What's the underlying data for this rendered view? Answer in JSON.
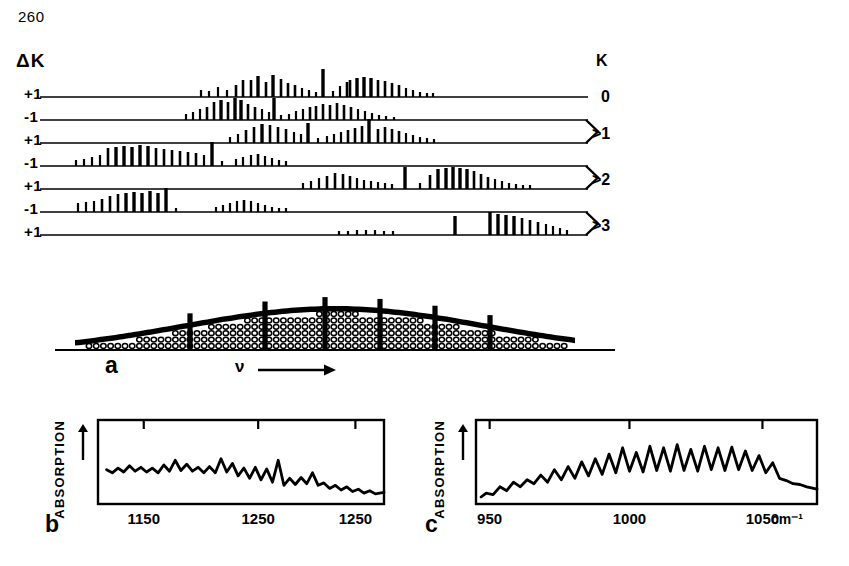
{
  "page_number": "260",
  "panel_a": {
    "left_axis_title": "ΔK",
    "right_axis_title": "K",
    "delta_k_labels": [
      "+1",
      "-1",
      "+1",
      "-1",
      "+1",
      "-1",
      "+1"
    ],
    "k_labels": [
      {
        "text": "0",
        "brace": false
      },
      {
        "text": "1",
        "brace": true
      },
      {
        "text": "2",
        "brace": true
      },
      {
        "text": "3",
        "brace": true
      }
    ],
    "k_brace_prefix": ">",
    "frequency_axis_label": "ν",
    "panel_label": "a",
    "traces": [
      {
        "delta_k": "+1",
        "k": "0",
        "sticks": [
          [
            201,
            7
          ],
          [
            209,
            6
          ],
          [
            218,
            10
          ],
          [
            227,
            7
          ],
          [
            236,
            12
          ],
          [
            243,
            17
          ],
          [
            251,
            17
          ],
          [
            258,
            21
          ],
          [
            266,
            15
          ],
          [
            273,
            22
          ],
          [
            281,
            18
          ],
          [
            288,
            14
          ],
          [
            295,
            12
          ],
          [
            302,
            9
          ],
          [
            309,
            7
          ],
          [
            316,
            5
          ],
          [
            323,
            28
          ],
          [
            333,
            6
          ],
          [
            340,
            11
          ],
          [
            347,
            15
          ],
          [
            350,
            17
          ],
          [
            357,
            19
          ],
          [
            364,
            20
          ],
          [
            371,
            19
          ],
          [
            378,
            17
          ],
          [
            385,
            16
          ],
          [
            392,
            14
          ],
          [
            399,
            12
          ],
          [
            406,
            9
          ],
          [
            413,
            7
          ],
          [
            420,
            5
          ],
          [
            427,
            4
          ],
          [
            433,
            4
          ]
        ]
      },
      {
        "delta_k": "-1",
        "k": "0",
        "sticks": [
          [
            186,
            6
          ],
          [
            193,
            8
          ],
          [
            200,
            11
          ],
          [
            207,
            13
          ],
          [
            214,
            18
          ],
          [
            221,
            20
          ],
          [
            228,
            18
          ],
          [
            235,
            22
          ],
          [
            241,
            20
          ],
          [
            248,
            16
          ],
          [
            255,
            13
          ],
          [
            262,
            11
          ],
          [
            269,
            8
          ],
          [
            274,
            22
          ],
          [
            281,
            5
          ],
          [
            289,
            6
          ],
          [
            296,
            9
          ],
          [
            303,
            11
          ],
          [
            310,
            13
          ],
          [
            316,
            14
          ],
          [
            323,
            16
          ],
          [
            330,
            15
          ],
          [
            337,
            17
          ],
          [
            344,
            15
          ],
          [
            351,
            13
          ],
          [
            358,
            11
          ],
          [
            365,
            9
          ],
          [
            372,
            7
          ],
          [
            379,
            5
          ],
          [
            386,
            4
          ],
          [
            394,
            3
          ]
        ]
      },
      {
        "delta_k": "+1",
        "k": "1",
        "sticks": [
          [
            230,
            6
          ],
          [
            238,
            9
          ],
          [
            246,
            13
          ],
          [
            254,
            16
          ],
          [
            262,
            19
          ],
          [
            270,
            18
          ],
          [
            278,
            16
          ],
          [
            286,
            14
          ],
          [
            294,
            11
          ],
          [
            301,
            9
          ],
          [
            308,
            20
          ],
          [
            318,
            5
          ],
          [
            327,
            7
          ],
          [
            334,
            9
          ],
          [
            341,
            11
          ],
          [
            348,
            13
          ],
          [
            355,
            15
          ],
          [
            362,
            17
          ],
          [
            369,
            24
          ],
          [
            378,
            14
          ],
          [
            385,
            16
          ],
          [
            392,
            14
          ],
          [
            399,
            12
          ],
          [
            406,
            10
          ],
          [
            413,
            8
          ],
          [
            420,
            6
          ],
          [
            427,
            5
          ],
          [
            434,
            4
          ]
        ]
      },
      {
        "delta_k": "-1",
        "k": "1",
        "sticks": [
          [
            76,
            6
          ],
          [
            84,
            7
          ],
          [
            92,
            9
          ],
          [
            100,
            11
          ],
          [
            108,
            18
          ],
          [
            116,
            19
          ],
          [
            124,
            20
          ],
          [
            132,
            19
          ],
          [
            140,
            21
          ],
          [
            148,
            20
          ],
          [
            156,
            18
          ],
          [
            164,
            17
          ],
          [
            172,
            16
          ],
          [
            180,
            15
          ],
          [
            188,
            14
          ],
          [
            196,
            13
          ],
          [
            204,
            11
          ],
          [
            212,
            24
          ],
          [
            222,
            5
          ],
          [
            236,
            7
          ],
          [
            243,
            9
          ],
          [
            251,
            11
          ],
          [
            258,
            12
          ],
          [
            265,
            10
          ],
          [
            272,
            8
          ],
          [
            279,
            6
          ],
          [
            286,
            5
          ]
        ]
      },
      {
        "delta_k": "+1",
        "k": "2",
        "sticks": [
          [
            303,
            6
          ],
          [
            311,
            8
          ],
          [
            319,
            11
          ],
          [
            327,
            13
          ],
          [
            335,
            16
          ],
          [
            343,
            15
          ],
          [
            350,
            13
          ],
          [
            357,
            11
          ],
          [
            364,
            9
          ],
          [
            371,
            8
          ],
          [
            378,
            7
          ],
          [
            385,
            6
          ],
          [
            392,
            5
          ],
          [
            405,
            22
          ],
          [
            420,
            6
          ],
          [
            430,
            14
          ],
          [
            438,
            20
          ],
          [
            446,
            21
          ],
          [
            453,
            22
          ],
          [
            460,
            21
          ],
          [
            467,
            20
          ],
          [
            474,
            18
          ],
          [
            481,
            15
          ],
          [
            488,
            12
          ],
          [
            495,
            10
          ],
          [
            502,
            8
          ],
          [
            509,
            6
          ],
          [
            516,
            5
          ],
          [
            523,
            4
          ],
          [
            530,
            4
          ]
        ]
      },
      {
        "delta_k": "-1",
        "k": "2",
        "sticks": [
          [
            78,
            9
          ],
          [
            86,
            10
          ],
          [
            94,
            11
          ],
          [
            102,
            13
          ],
          [
            110,
            16
          ],
          [
            118,
            18
          ],
          [
            126,
            19
          ],
          [
            134,
            20
          ],
          [
            142,
            19
          ],
          [
            150,
            21
          ],
          [
            158,
            19
          ],
          [
            166,
            24
          ],
          [
            176,
            4
          ],
          [
            216,
            5
          ],
          [
            223,
            7
          ],
          [
            230,
            9
          ],
          [
            237,
            11
          ],
          [
            244,
            12
          ],
          [
            251,
            11
          ],
          [
            258,
            9
          ],
          [
            265,
            7
          ],
          [
            272,
            5
          ],
          [
            279,
            4
          ],
          [
            286,
            4
          ]
        ]
      },
      {
        "delta_k": "+1",
        "k": "3",
        "sticks": [
          [
            339,
            4
          ],
          [
            348,
            4
          ],
          [
            357,
            5
          ],
          [
            366,
            5
          ],
          [
            375,
            5
          ],
          [
            384,
            4
          ],
          [
            393,
            4
          ],
          [
            455,
            19
          ],
          [
            490,
            23
          ],
          [
            498,
            21
          ],
          [
            506,
            20
          ],
          [
            514,
            19
          ],
          [
            522,
            17
          ],
          [
            530,
            15
          ],
          [
            538,
            13
          ],
          [
            546,
            11
          ],
          [
            553,
            9
          ],
          [
            560,
            7
          ],
          [
            567,
            5
          ]
        ]
      }
    ],
    "envelope": {
      "description": "band contour with stippled sub-band regions",
      "tick_positions": [
        170,
        245,
        305,
        360,
        415,
        470
      ],
      "stipple_fill": true
    }
  },
  "panel_b": {
    "panel_label": "b",
    "y_axis_label": "ABSORPTION",
    "y_axis_arrow": "up-arrow",
    "x_ticks": [
      "1150",
      "1250",
      "1250"
    ],
    "x_tick_positions": [
      0.16,
      0.56,
      0.9
    ],
    "spectrum": {
      "type": "line",
      "description": "rotationally resolved absorption band, decaying to the red",
      "points": [
        [
          0.03,
          0.44
        ],
        [
          0.05,
          0.4
        ],
        [
          0.07,
          0.46
        ],
        [
          0.09,
          0.41
        ],
        [
          0.11,
          0.49
        ],
        [
          0.13,
          0.42
        ],
        [
          0.15,
          0.47
        ],
        [
          0.17,
          0.41
        ],
        [
          0.19,
          0.46
        ],
        [
          0.21,
          0.4
        ],
        [
          0.23,
          0.5
        ],
        [
          0.25,
          0.42
        ],
        [
          0.27,
          0.56
        ],
        [
          0.29,
          0.43
        ],
        [
          0.31,
          0.51
        ],
        [
          0.33,
          0.42
        ],
        [
          0.35,
          0.47
        ],
        [
          0.37,
          0.4
        ],
        [
          0.39,
          0.48
        ],
        [
          0.41,
          0.4
        ],
        [
          0.43,
          0.58
        ],
        [
          0.45,
          0.41
        ],
        [
          0.47,
          0.52
        ],
        [
          0.49,
          0.36
        ],
        [
          0.51,
          0.46
        ],
        [
          0.53,
          0.33
        ],
        [
          0.55,
          0.47
        ],
        [
          0.57,
          0.31
        ],
        [
          0.59,
          0.45
        ],
        [
          0.61,
          0.28
        ],
        [
          0.63,
          0.56
        ],
        [
          0.65,
          0.24
        ],
        [
          0.67,
          0.33
        ],
        [
          0.69,
          0.25
        ],
        [
          0.71,
          0.34
        ],
        [
          0.73,
          0.26
        ],
        [
          0.75,
          0.4
        ],
        [
          0.77,
          0.24
        ],
        [
          0.79,
          0.27
        ],
        [
          0.81,
          0.2
        ],
        [
          0.83,
          0.24
        ],
        [
          0.85,
          0.18
        ],
        [
          0.87,
          0.22
        ],
        [
          0.89,
          0.16
        ],
        [
          0.91,
          0.19
        ],
        [
          0.93,
          0.14
        ],
        [
          0.95,
          0.17
        ],
        [
          0.97,
          0.13
        ],
        [
          1.0,
          0.15
        ]
      ]
    }
  },
  "panel_c": {
    "panel_label": "c",
    "y_axis_label": "ABSORPTION",
    "y_axis_arrow": "up-arrow",
    "x_ticks": [
      "950",
      "1000",
      "1050"
    ],
    "x_tick_positions": [
      0.04,
      0.45,
      0.84
    ],
    "x_unit": "cm⁻¹",
    "spectrum": {
      "type": "line",
      "description": "regularly spaced rotational structure peaking near 1010 cm-1",
      "points": [
        [
          0.015,
          0.09
        ],
        [
          0.03,
          0.14
        ],
        [
          0.05,
          0.12
        ],
        [
          0.07,
          0.22
        ],
        [
          0.09,
          0.17
        ],
        [
          0.11,
          0.28
        ],
        [
          0.13,
          0.22
        ],
        [
          0.15,
          0.31
        ],
        [
          0.17,
          0.26
        ],
        [
          0.19,
          0.37
        ],
        [
          0.21,
          0.28
        ],
        [
          0.23,
          0.44
        ],
        [
          0.25,
          0.31
        ],
        [
          0.27,
          0.48
        ],
        [
          0.29,
          0.33
        ],
        [
          0.31,
          0.54
        ],
        [
          0.33,
          0.36
        ],
        [
          0.35,
          0.58
        ],
        [
          0.37,
          0.38
        ],
        [
          0.39,
          0.64
        ],
        [
          0.41,
          0.4
        ],
        [
          0.43,
          0.72
        ],
        [
          0.45,
          0.42
        ],
        [
          0.47,
          0.66
        ],
        [
          0.49,
          0.41
        ],
        [
          0.51,
          0.74
        ],
        [
          0.53,
          0.43
        ],
        [
          0.55,
          0.72
        ],
        [
          0.57,
          0.42
        ],
        [
          0.59,
          0.76
        ],
        [
          0.61,
          0.43
        ],
        [
          0.63,
          0.7
        ],
        [
          0.65,
          0.42
        ],
        [
          0.67,
          0.74
        ],
        [
          0.69,
          0.44
        ],
        [
          0.71,
          0.72
        ],
        [
          0.73,
          0.43
        ],
        [
          0.75,
          0.73
        ],
        [
          0.77,
          0.44
        ],
        [
          0.79,
          0.68
        ],
        [
          0.81,
          0.43
        ],
        [
          0.83,
          0.62
        ],
        [
          0.85,
          0.4
        ],
        [
          0.87,
          0.53
        ],
        [
          0.89,
          0.33
        ],
        [
          0.91,
          0.3
        ],
        [
          0.93,
          0.26
        ],
        [
          0.95,
          0.25
        ],
        [
          0.97,
          0.22
        ],
        [
          1.0,
          0.19
        ]
      ]
    }
  }
}
